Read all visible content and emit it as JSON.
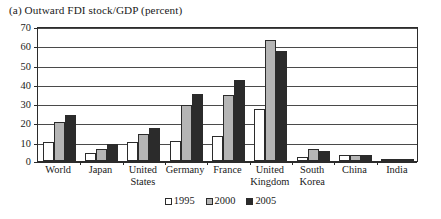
{
  "chart_data": {
    "type": "bar",
    "title": "(a) Outward FDI stock/GDP (percent)",
    "xlabel": "",
    "ylabel": "",
    "ylim": [
      0,
      70
    ],
    "yticks": [
      0,
      10,
      20,
      30,
      40,
      50,
      60,
      70
    ],
    "ytick_labels": [
      "0",
      "10",
      "20",
      "30",
      "40",
      "50",
      "60",
      "70"
    ],
    "grid": true,
    "legend_position": "bottom-center",
    "categories": [
      "World",
      "Japan",
      "United States",
      "Germany",
      "France",
      "United Kingdom",
      "South Korea",
      "China",
      "India"
    ],
    "category_lines": [
      [
        "World"
      ],
      [
        "Japan"
      ],
      [
        "United",
        "States"
      ],
      [
        "Germany"
      ],
      [
        "France"
      ],
      [
        "United",
        "Kingdom"
      ],
      [
        "South",
        "Korea"
      ],
      [
        "China"
      ],
      [
        "India"
      ]
    ],
    "series": [
      {
        "name": "1995",
        "color": "#ffffff",
        "values": [
          10.0,
          4.2,
          10.0,
          10.3,
          13.0,
          27.0,
          2.0,
          3.0,
          0.3
        ]
      },
      {
        "name": "2000",
        "color": "#b5b5b5",
        "values": [
          20.0,
          6.0,
          14.0,
          29.0,
          34.0,
          63.0,
          6.0,
          3.0,
          0.5
        ]
      },
      {
        "name": "2005",
        "color": "#2b2b2b",
        "values": [
          24.0,
          9.0,
          17.0,
          35.0,
          42.0,
          57.0,
          5.0,
          3.0,
          1.0
        ]
      }
    ]
  },
  "legend": {
    "items": [
      {
        "label": "1995"
      },
      {
        "label": "2000"
      },
      {
        "label": "2005"
      }
    ]
  }
}
